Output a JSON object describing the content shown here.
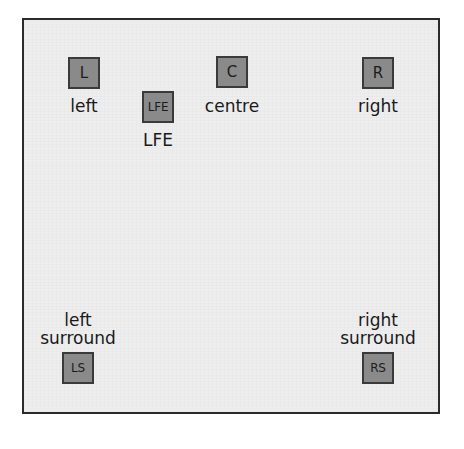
{
  "diagram": {
    "frame": {
      "border_color": "#2b2b2b",
      "background_color": "#eeeeee"
    },
    "box_style": {
      "fill_color": "#8a8a8a",
      "border_color": "#3a3a3a",
      "text_color": "#1c1c1c"
    },
    "label_color": "#1a1a1a",
    "speakers": [
      {
        "id": "left",
        "abbreviation": "L",
        "label_lines": [
          "left"
        ],
        "label_position": "below",
        "position": "front-left"
      },
      {
        "id": "lfe",
        "abbreviation": "LFE",
        "label_lines": [
          "LFE"
        ],
        "label_position": "below",
        "position": "front-centre-left"
      },
      {
        "id": "centre",
        "abbreviation": "C",
        "label_lines": [
          "centre"
        ],
        "label_position": "below",
        "position": "front-centre"
      },
      {
        "id": "right",
        "abbreviation": "R",
        "label_lines": [
          "right"
        ],
        "label_position": "below",
        "position": "front-right"
      },
      {
        "id": "left-surround",
        "abbreviation": "LS",
        "label_lines": [
          "left",
          "surround"
        ],
        "label_position": "above",
        "position": "rear-left"
      },
      {
        "id": "right-surround",
        "abbreviation": "RS",
        "label_lines": [
          "right",
          "surround"
        ],
        "label_position": "above",
        "position": "rear-right"
      }
    ]
  }
}
